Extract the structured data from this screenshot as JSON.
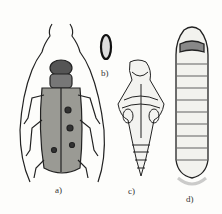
{
  "figure": {
    "panels": [
      {
        "id": "a",
        "label": "a)",
        "subject": "adult longhorn beetle"
      },
      {
        "id": "b",
        "label": "b)",
        "subject": "egg"
      },
      {
        "id": "c",
        "label": "c)",
        "subject": "pupa"
      },
      {
        "id": "d",
        "label": "d)",
        "subject": "larva"
      }
    ],
    "colors": {
      "ink": "#222222",
      "background": "#fdfdfb"
    }
  }
}
